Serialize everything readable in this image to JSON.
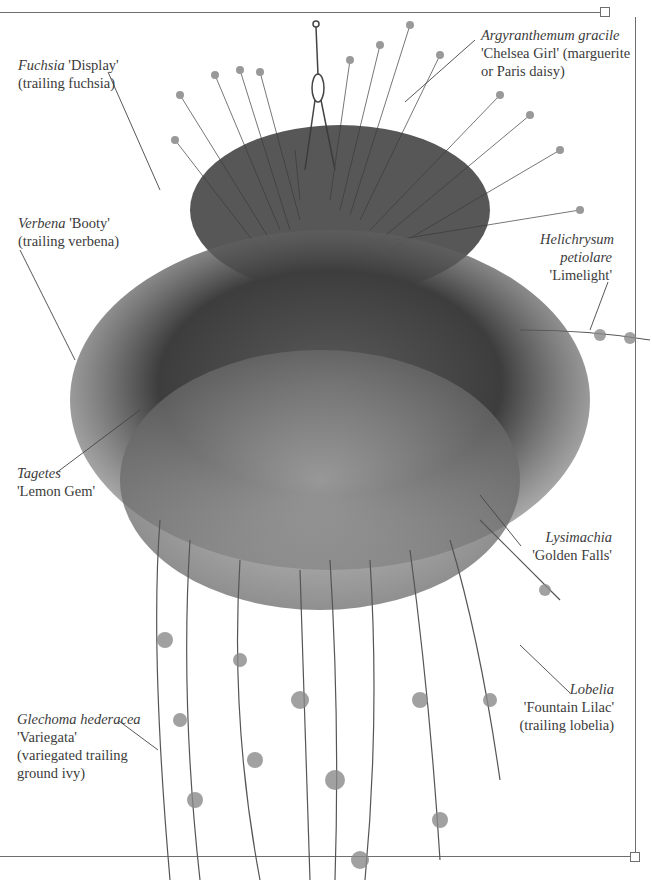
{
  "figure": {
    "frame": {
      "line_color": "#6f6f6f"
    }
  },
  "labels": [
    {
      "id": "fuchsia",
      "latin": "Fuchsia",
      "cultivar": "'Display'",
      "common": "(trailing fuchsia)"
    },
    {
      "id": "argyranthemum",
      "latin": "Argyranthemum gracile",
      "cultivar": "'Chelsea Girl' (marguerite",
      "common": "or Paris daisy)"
    },
    {
      "id": "verbena",
      "latin": "Verbena",
      "cultivar": "'Booty'",
      "common": "(trailing verbena)"
    },
    {
      "id": "helichrysum",
      "latin_line1": "Helichrysum",
      "latin_line2": "petiolare",
      "cultivar": "'Limelight'"
    },
    {
      "id": "tagetes",
      "latin": "Tagetes",
      "cultivar": "'Lemon Gem'"
    },
    {
      "id": "lysimachia",
      "latin": "Lysimachia",
      "cultivar": "'Golden Falls'"
    },
    {
      "id": "lobelia",
      "latin": "Lobelia",
      "cultivar": "'Fountain Lilac'",
      "common": "(trailing lobelia)"
    },
    {
      "id": "glechoma",
      "latin": "Glechoma hederacea",
      "cultivar": "'Variegata'",
      "common_line1": "(variegated trailing",
      "common_line2": "ground ivy)"
    }
  ]
}
